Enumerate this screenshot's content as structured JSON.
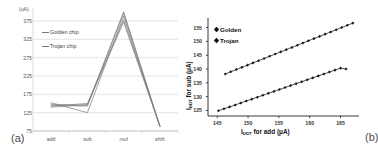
{
  "figure": {
    "panel_a_caption": "(a)",
    "panel_b_caption": "(b)"
  },
  "chart_data": [
    {
      "id": "panel-a",
      "type": "line",
      "title": "",
      "subtitle": "",
      "xlabel": "",
      "ylabel": "",
      "yunits": "(uA)",
      "categories": [
        "add",
        "sub",
        "mul",
        "shift"
      ],
      "yticks": [
        375,
        325,
        275,
        225,
        175,
        125,
        75
      ],
      "ylim": [
        75,
        405
      ],
      "grid": true,
      "legend_position": "inside-top-left",
      "legend": [
        "Golden chip",
        "Trojan chip"
      ],
      "series": [
        {
          "name": "Golden chip 1",
          "values": [
            148,
            145,
            400,
            88
          ]
        },
        {
          "name": "Golden chip 2",
          "values": [
            145,
            143,
            396,
            88
          ]
        },
        {
          "name": "Golden chip 3",
          "values": [
            152,
            125,
            388,
            88
          ]
        },
        {
          "name": "Trojan chip 1",
          "values": [
            143,
            150,
            378,
            88
          ]
        },
        {
          "name": "Trojan chip 2",
          "values": [
            140,
            147,
            372,
            88
          ]
        }
      ]
    },
    {
      "id": "panel-b",
      "type": "scatter",
      "title": "",
      "xlabel": "I_DDT for add (uA)",
      "xlabel_main": " for add (",
      "xlabel_lead": "I",
      "xlabel_sub": "DDT",
      "xlabel_tail": "μA)",
      "ylabel": "I_DDT for sub (uA)",
      "ylabel_lead": "I",
      "ylabel_sub": "DDT",
      "ylabel_main": " for sub (",
      "ylabel_tail": "μA)",
      "xticks": [
        145,
        150,
        155,
        160,
        165
      ],
      "yticks": [
        155,
        150,
        145,
        140,
        135,
        130,
        125
      ],
      "xlim": [
        143.5,
        168
      ],
      "ylim": [
        123,
        157
      ],
      "grid": false,
      "legend_position": "inside-top-left",
      "legend": [
        "Golden",
        "Trojan"
      ],
      "series": [
        {
          "name": "Golden",
          "marker": "diamond",
          "x": [
            146.3,
            147.2,
            148.1,
            149.0,
            149.9,
            150.8,
            151.7,
            152.6,
            153.5,
            154.4,
            155.3,
            156.2,
            157.1,
            158.0,
            158.9,
            159.8,
            160.7,
            161.6,
            162.5,
            163.4,
            164.3,
            165.2,
            166.1,
            167.0
          ],
          "y": [
            138.2,
            139.0,
            139.8,
            140.6,
            141.4,
            142.2,
            143.0,
            143.8,
            144.6,
            145.4,
            146.2,
            147.0,
            147.8,
            148.6,
            149.4,
            150.2,
            151.0,
            151.8,
            152.6,
            153.4,
            154.2,
            155.0,
            155.8,
            156.6
          ]
        },
        {
          "name": "Trojan",
          "marker": "diamond",
          "x": [
            145.2,
            146.1,
            147.0,
            147.9,
            148.8,
            149.7,
            150.6,
            151.5,
            152.4,
            153.3,
            154.2,
            155.1,
            156.0,
            156.9,
            157.8,
            158.7,
            159.6,
            160.5,
            161.4,
            162.3,
            163.2,
            164.1,
            165.0,
            165.9
          ],
          "y": [
            124.9,
            125.6,
            126.3,
            127.0,
            127.7,
            128.4,
            129.1,
            129.8,
            130.5,
            131.2,
            131.9,
            132.6,
            133.3,
            134.0,
            134.7,
            135.4,
            136.1,
            136.8,
            137.5,
            138.2,
            138.9,
            139.6,
            140.3,
            140.0
          ]
        }
      ]
    }
  ]
}
